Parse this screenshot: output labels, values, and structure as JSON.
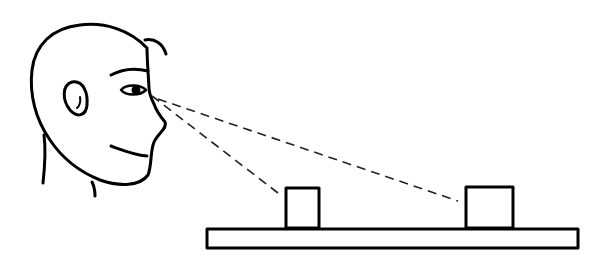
{
  "diagram": {
    "elements": [
      {
        "id": "head",
        "type": "outline",
        "label": "observer head (profile)"
      },
      {
        "id": "eye",
        "type": "feature",
        "label": "eye"
      },
      {
        "id": "sightline-near",
        "type": "dashed-line",
        "label": "line of sight to small block"
      },
      {
        "id": "sightline-far",
        "type": "dashed-line",
        "label": "line of sight to large block"
      },
      {
        "id": "block-small",
        "type": "rectangle",
        "label": "small block"
      },
      {
        "id": "block-large",
        "type": "rectangle",
        "label": "large block"
      },
      {
        "id": "base",
        "type": "rectangle",
        "label": "base board"
      }
    ],
    "colors": {
      "ink": "#000000",
      "background": "#ffffff"
    }
  }
}
